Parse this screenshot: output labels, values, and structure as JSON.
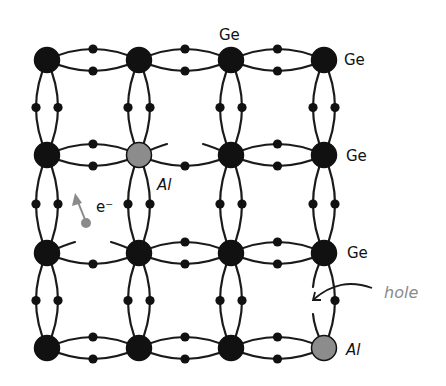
{
  "diagram": {
    "colors": {
      "ge_atom": "#111111",
      "al_atom": "#8c8c8c",
      "bond": "#1a1a1a",
      "electron": "#111111",
      "annotation": "#8a8a8a"
    },
    "grid": {
      "columns_x": [
        47,
        139,
        231,
        324
      ],
      "rows_y": [
        60,
        155,
        253,
        348
      ]
    },
    "atoms": [
      {
        "row": 0,
        "col": 0,
        "element": "Ge"
      },
      {
        "row": 0,
        "col": 1,
        "element": "Ge"
      },
      {
        "row": 0,
        "col": 2,
        "element": "Ge"
      },
      {
        "row": 0,
        "col": 3,
        "element": "Ge"
      },
      {
        "row": 1,
        "col": 0,
        "element": "Ge"
      },
      {
        "row": 1,
        "col": 1,
        "element": "Al"
      },
      {
        "row": 1,
        "col": 2,
        "element": "Ge"
      },
      {
        "row": 1,
        "col": 3,
        "element": "Ge"
      },
      {
        "row": 2,
        "col": 0,
        "element": "Ge"
      },
      {
        "row": 2,
        "col": 1,
        "element": "Ge"
      },
      {
        "row": 2,
        "col": 2,
        "element": "Ge"
      },
      {
        "row": 2,
        "col": 3,
        "element": "Ge"
      },
      {
        "row": 3,
        "col": 0,
        "element": "Ge"
      },
      {
        "row": 3,
        "col": 1,
        "element": "Ge"
      },
      {
        "row": 3,
        "col": 2,
        "element": "Ge"
      },
      {
        "row": 3,
        "col": 3,
        "element": "Al"
      }
    ],
    "labels": {
      "ge_top": "Ge",
      "ge_right_row0": "Ge",
      "ge_right_row1": "Ge",
      "ge_right_row2": "Ge",
      "al_center": "Al",
      "al_corner": "Al",
      "electron": "e⁻",
      "hole": "hole"
    },
    "broken_bonds": [
      {
        "from": [
          1,
          1
        ],
        "to": [
          1,
          2
        ],
        "side": "upper"
      },
      {
        "from": [
          2,
          0
        ],
        "to": [
          2,
          1
        ],
        "side": "upper"
      },
      {
        "from": [
          2,
          3
        ],
        "to": [
          3,
          3
        ],
        "side": "left",
        "label": "hole"
      }
    ]
  }
}
